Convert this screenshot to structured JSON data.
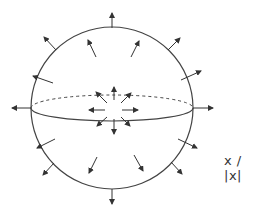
{
  "diagram": {
    "title": "",
    "label": "x / |x|",
    "colors": {
      "stroke": "#333333",
      "background": "#ffffff"
    }
  }
}
